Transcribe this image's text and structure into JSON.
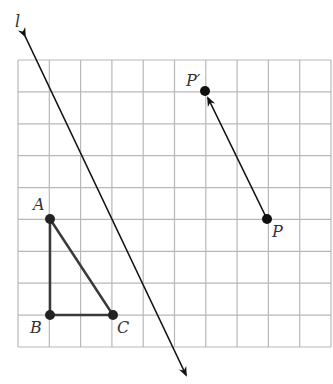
{
  "diagram": {
    "grid": {
      "cols": 10,
      "rows": 9,
      "color": "#b8b8b8"
    },
    "line_label": "l",
    "points": {
      "A": {
        "label": "A"
      },
      "B": {
        "label": "B"
      },
      "C": {
        "label": "C"
      },
      "P": {
        "label": "P"
      },
      "P_prime": {
        "label": "P′"
      }
    },
    "triangle": [
      "A",
      "B",
      "C"
    ],
    "vector": {
      "from": "P",
      "to": "P′"
    },
    "colors": {
      "stroke": "#222222",
      "triangle": "#3a3a3a"
    }
  }
}
